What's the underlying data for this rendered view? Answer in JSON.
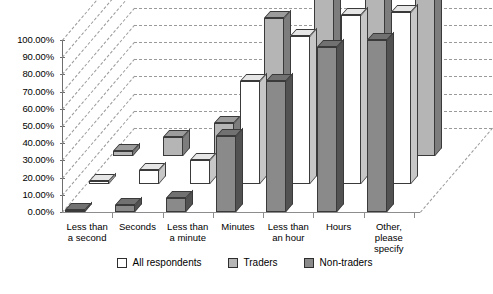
{
  "chart_data": {
    "type": "bar",
    "title": "",
    "subtitle": "",
    "xlabel": "",
    "ylabel": "",
    "ylim": [
      0,
      100
    ],
    "ytick_labels": [
      "0.00%",
      "10.00%",
      "20.00%",
      "30.00%",
      "40.00%",
      "50.00%",
      "60.00%",
      "70.00%",
      "80.00%",
      "90.00%",
      "100.00%"
    ],
    "ytick_values": [
      0,
      10,
      20,
      30,
      40,
      50,
      60,
      70,
      80,
      90,
      100
    ],
    "grid": true,
    "legend_position": "bottom",
    "three_d": true,
    "categories": [
      "Less than\na second",
      "Seconds",
      "Less than\na minute",
      "Minutes",
      "Less than\nan hour",
      "Hours",
      "Other,\nplease\nspecify"
    ],
    "series": [
      {
        "name": "All respondents",
        "color": "#ffffff",
        "values": [
          2.0,
          8.0,
          14.0,
          60.0,
          86.0,
          98.0,
          100.0
        ]
      },
      {
        "name": "Traders",
        "color": "#b5b5b5",
        "values": [
          3.0,
          11.0,
          19.0,
          80.0,
          92.0,
          100.0,
          100.0
        ]
      },
      {
        "name": "Non-traders",
        "color": "#8a8a8a",
        "values": [
          1.0,
          4.0,
          8.0,
          44.0,
          76.0,
          96.0,
          100.0
        ]
      }
    ],
    "draw_order": [
      "Traders",
      "All respondents",
      "Non-traders"
    ]
  },
  "legend": {
    "items": [
      {
        "label": "All respondents",
        "color": "#ffffff"
      },
      {
        "label": "Traders",
        "color": "#b5b5b5"
      },
      {
        "label": "Non-traders",
        "color": "#8a8a8a"
      }
    ]
  }
}
